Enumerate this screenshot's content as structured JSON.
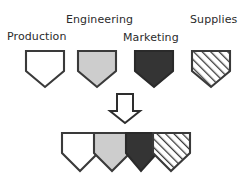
{
  "diagram": {
    "background_color": "#ffffff",
    "stroke_color": "#3a3a3a",
    "text_color": "#2b2b2b"
  },
  "labels": {
    "production": "Production",
    "engineering": "Engineering",
    "marketing": "Marketing",
    "supplies": "Supplies"
  },
  "shapes": {
    "production": {
      "name": "Production",
      "fill_label": "white",
      "fill": "#ffffff",
      "pattern": "solid"
    },
    "engineering": {
      "name": "Engineering",
      "fill_label": "light gray",
      "fill": "#cdcdcd",
      "pattern": "solid"
    },
    "marketing": {
      "name": "Marketing",
      "fill_label": "dark gray",
      "fill": "#343434",
      "pattern": "solid"
    },
    "supplies": {
      "name": "Supplies",
      "fill_label": "diagonal hatch",
      "fill": "#ffffff",
      "pattern": "diagonal-hatch"
    }
  },
  "arrow": {
    "name": "down-arrow",
    "direction": "down",
    "fill": "#ffffff",
    "stroke": "#2e2e2e"
  },
  "combined_row": {
    "name": "combined-shields",
    "order": [
      "Production",
      "Engineering",
      "Marketing",
      "Supplies"
    ]
  }
}
